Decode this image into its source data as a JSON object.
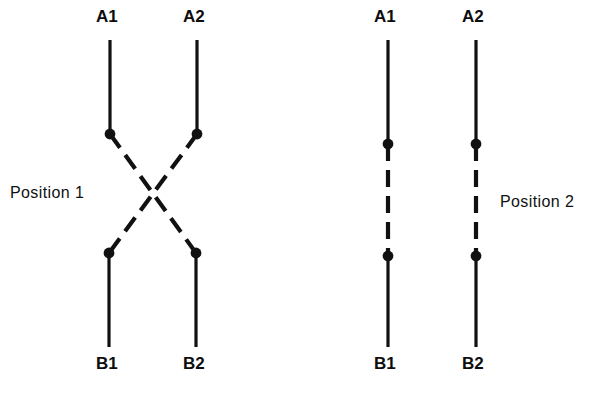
{
  "figure": {
    "background_color": "#ffffff",
    "stroke_color": "#111111",
    "canvas": {
      "width": 591,
      "height": 400
    }
  },
  "diagrams": [
    {
      "id": "position-1",
      "caption": "Position 1",
      "caption_x": 10,
      "caption_y": 185,
      "state": "crossed",
      "terminals": {
        "top_left": "A1",
        "top_right": "A2",
        "bottom_left": "B1",
        "bottom_right": "B2"
      },
      "labels": [
        {
          "text": "A1",
          "x": 96,
          "y": 8
        },
        {
          "text": "A2",
          "x": 183,
          "y": 8
        },
        {
          "text": "B1",
          "x": 96,
          "y": 355
        },
        {
          "text": "B2",
          "x": 183,
          "y": 355
        }
      ],
      "nodes": [
        {
          "name": "node-a1",
          "x": 110,
          "y": 134
        },
        {
          "name": "node-a2",
          "x": 197,
          "y": 134
        },
        {
          "name": "node-b1",
          "x": 109,
          "y": 253
        },
        {
          "name": "node-b2",
          "x": 196,
          "y": 253
        }
      ],
      "solid_segments": [
        {
          "name": "lead-a1",
          "x1": 110,
          "y1": 40,
          "x2": 110,
          "y2": 134
        },
        {
          "name": "lead-a2",
          "x1": 197,
          "y1": 40,
          "x2": 197,
          "y2": 134
        },
        {
          "name": "lead-b1",
          "x1": 109,
          "y1": 253,
          "x2": 109,
          "y2": 347
        },
        {
          "name": "lead-b2",
          "x1": 196,
          "y1": 253,
          "x2": 196,
          "y2": 347
        }
      ],
      "dashed_segments": [
        {
          "name": "contact-a1-to-b2",
          "x1": 110,
          "y1": 134,
          "x2": 196,
          "y2": 253
        },
        {
          "name": "contact-a2-to-b1",
          "x1": 197,
          "y1": 134,
          "x2": 109,
          "y2": 253
        }
      ]
    },
    {
      "id": "position-2",
      "caption": "Position 2",
      "caption_x": 500,
      "caption_y": 194,
      "state": "straight",
      "terminals": {
        "top_left": "A1",
        "top_right": "A2",
        "bottom_left": "B1",
        "bottom_right": "B2"
      },
      "labels": [
        {
          "text": "A1",
          "x": 374,
          "y": 8
        },
        {
          "text": "A2",
          "x": 462,
          "y": 8
        },
        {
          "text": "B1",
          "x": 374,
          "y": 355
        },
        {
          "text": "B2",
          "x": 462,
          "y": 355
        }
      ],
      "nodes": [
        {
          "name": "node-a1",
          "x": 388,
          "y": 144
        },
        {
          "name": "node-a2",
          "x": 476,
          "y": 144
        },
        {
          "name": "node-b1",
          "x": 388,
          "y": 256
        },
        {
          "name": "node-b2",
          "x": 476,
          "y": 256
        }
      ],
      "solid_segments": [
        {
          "name": "lead-a1",
          "x1": 388,
          "y1": 40,
          "x2": 388,
          "y2": 144
        },
        {
          "name": "lead-a2",
          "x1": 476,
          "y1": 40,
          "x2": 476,
          "y2": 144
        },
        {
          "name": "lead-b1",
          "x1": 388,
          "y1": 256,
          "x2": 388,
          "y2": 347
        },
        {
          "name": "lead-b2",
          "x1": 476,
          "y1": 256,
          "x2": 476,
          "y2": 347
        }
      ],
      "dashed_segments": [
        {
          "name": "contact-a1-to-b1",
          "x1": 388,
          "y1": 144,
          "x2": 388,
          "y2": 256
        },
        {
          "name": "contact-a2-to-b2",
          "x1": 476,
          "y1": 144,
          "x2": 476,
          "y2": 256
        }
      ]
    }
  ],
  "style": {
    "solid_stroke_width": 3.2,
    "dashed_stroke_width": 4.2,
    "dash_pattern": "17 9",
    "node_radius": 5.4
  }
}
